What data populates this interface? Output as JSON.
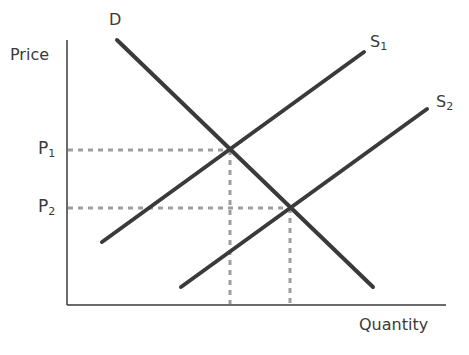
{
  "diagram": {
    "type": "supply-demand",
    "axes": {
      "y_label": "Price",
      "x_label": "Quantity"
    },
    "price_labels": [
      {
        "base": "P",
        "sub": "1"
      },
      {
        "base": "P",
        "sub": "2"
      }
    ],
    "curves": [
      {
        "id": "demand",
        "base": "D",
        "sub": ""
      },
      {
        "id": "supply1",
        "base": "S",
        "sub": "1"
      },
      {
        "id": "supply2",
        "base": "S",
        "sub": "2"
      }
    ],
    "equilibria": [
      {
        "price": "P1",
        "curves": [
          "D",
          "S1"
        ]
      },
      {
        "price": "P2",
        "curves": [
          "D",
          "S2"
        ]
      }
    ],
    "colors": {
      "curve": "#3a3a3a",
      "axis": "#3a3a3a",
      "dashed": "#9e9e9e"
    }
  }
}
